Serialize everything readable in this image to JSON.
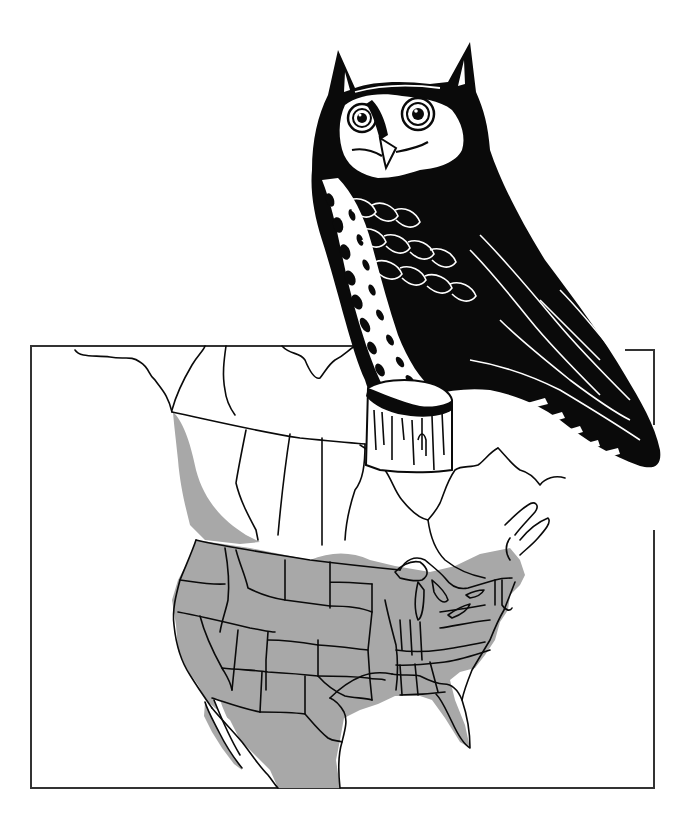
{
  "figure": {
    "illustration_style": "black-and-white line art",
    "colors": {
      "background": "#ffffff",
      "ink": "#0a0a0a",
      "range_fill": "#a8a8a8",
      "frame": "#333333"
    }
  },
  "map": {
    "region": "North America",
    "frame": {
      "x": 31,
      "y": 345,
      "width": 623,
      "height": 443
    },
    "legend": {
      "shaded_meaning": "range"
    },
    "shaded_areas": [
      "Pacific coast of British Columbia",
      "Contiguous United States",
      "Southern edge of Canada along US border",
      "Northern Mexico"
    ]
  },
  "owl": {
    "pose": "perched on tree stump",
    "position": "upper right, overlapping map frame"
  }
}
